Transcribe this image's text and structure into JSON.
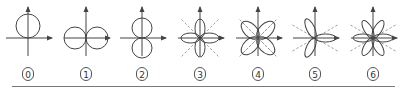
{
  "diagram": {
    "title": "",
    "stroke_color": "#444444",
    "dashed_color": "#888888",
    "figures": [
      {
        "id": 0,
        "label": "0",
        "cx": 28,
        "shape": "circle-up",
        "dashed_lines": false
      },
      {
        "id": 1,
        "label": "1",
        "cx": 86,
        "shape": "two-circles-horizontal",
        "dashed_lines": false
      },
      {
        "id": 2,
        "label": "2",
        "cx": 142,
        "shape": "two-circles-vertical",
        "dashed_lines": false
      },
      {
        "id": 3,
        "label": "3",
        "cx": 200,
        "shape": "four-lobes-axial",
        "dashed_lines": true
      },
      {
        "id": 4,
        "label": "4",
        "cx": 258,
        "shape": "four-lobes-diagonal",
        "dashed_lines": true
      },
      {
        "id": 5,
        "label": "5",
        "cx": 315,
        "shape": "three-lobes",
        "dashed_lines": true
      },
      {
        "id": 6,
        "label": "6",
        "cx": 373,
        "shape": "six-lobes",
        "dashed_lines": true
      }
    ],
    "axis_y": 38,
    "axis_top": 7,
    "axis_bottom": 56,
    "axis_half_width": 22
  }
}
